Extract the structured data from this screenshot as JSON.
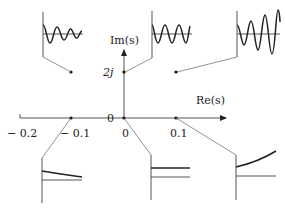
{
  "diagram": {
    "axes": {
      "real_label": "Re(s)",
      "imag_label": "Im(s)",
      "origin_marker": "0",
      "real_ticks": [
        "− 0.2",
        "− 0.1",
        "0",
        "0.1"
      ],
      "imag_ticks": [
        "2j"
      ]
    },
    "poles": [
      {
        "re": -0.1,
        "im": 2,
        "response": "damped oscillation"
      },
      {
        "re": 0,
        "im": 2,
        "response": "sustained oscillation"
      },
      {
        "re": 0.1,
        "im": 2,
        "response": "growing oscillation"
      },
      {
        "re": -0.1,
        "im": 0,
        "response": "decaying exponential"
      },
      {
        "re": 0,
        "im": 0,
        "response": "constant"
      },
      {
        "re": 0.1,
        "im": 0,
        "response": "growing exponential"
      }
    ]
  }
}
